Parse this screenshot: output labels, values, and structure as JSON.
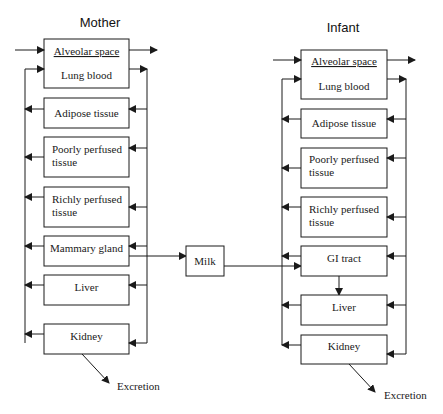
{
  "mother": {
    "title": "Mother",
    "alveolar": "Alveolar space",
    "lung_blood": "Lung blood",
    "adipose": "Adipose tissue",
    "poorly_1": "Poorly perfused",
    "poorly_2": "tissue",
    "richly_1": "Richly perfused",
    "richly_2": "tissue",
    "mammary": "Mammary gland",
    "liver": "Liver",
    "kidney": "Kidney",
    "excretion": "Excretion"
  },
  "milk": "Milk",
  "infant": {
    "title": "Infant",
    "alveolar": "Alveolar space",
    "lung_blood": "Lung blood",
    "adipose": "Adipose tissue",
    "poorly_1": "Poorly perfused",
    "poorly_2": "tissue",
    "richly_1": "Richly perfused",
    "richly_2": "tissue",
    "gi": "GI tract",
    "liver": "Liver",
    "kidney": "Kidney",
    "excretion": "Excretion"
  },
  "colors": {
    "stroke": "#1a1a1a",
    "background": "#ffffff"
  }
}
